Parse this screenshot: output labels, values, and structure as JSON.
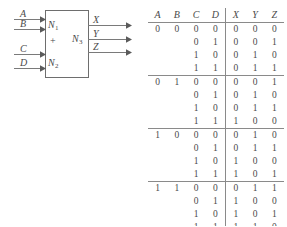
{
  "diagram": {
    "inputs": [
      {
        "label": "A"
      },
      {
        "label": "B"
      },
      {
        "label": "C"
      },
      {
        "label": "D"
      }
    ],
    "blocks": [
      {
        "name": "N",
        "sub": "1"
      },
      {
        "name": "N",
        "sub": "2"
      },
      {
        "name": "N",
        "sub": "3"
      }
    ],
    "operator": "+",
    "outputs": [
      {
        "label": "X"
      },
      {
        "label": "Y"
      },
      {
        "label": "Z"
      }
    ],
    "line_color": "#7a7a7a",
    "box_color": "#6e6e6e"
  },
  "truth_table": {
    "input_headers": [
      "A",
      "B",
      "C",
      "D"
    ],
    "output_headers": [
      "X",
      "Y",
      "Z"
    ],
    "rows": [
      {
        "a": "0",
        "b": "0",
        "c": "0",
        "d": "0",
        "x": "0",
        "y": "0",
        "z": "0",
        "group_start": true
      },
      {
        "a": "",
        "b": "",
        "c": "0",
        "d": "1",
        "x": "0",
        "y": "0",
        "z": "1",
        "group_start": false
      },
      {
        "a": "",
        "b": "",
        "c": "1",
        "d": "0",
        "x": "0",
        "y": "1",
        "z": "0",
        "group_start": false
      },
      {
        "a": "",
        "b": "",
        "c": "1",
        "d": "1",
        "x": "0",
        "y": "1",
        "z": "1",
        "group_start": false
      },
      {
        "a": "0",
        "b": "1",
        "c": "0",
        "d": "0",
        "x": "0",
        "y": "0",
        "z": "1",
        "group_start": true
      },
      {
        "a": "",
        "b": "",
        "c": "0",
        "d": "1",
        "x": "0",
        "y": "1",
        "z": "0",
        "group_start": false
      },
      {
        "a": "",
        "b": "",
        "c": "1",
        "d": "0",
        "x": "0",
        "y": "1",
        "z": "1",
        "group_start": false
      },
      {
        "a": "",
        "b": "",
        "c": "1",
        "d": "1",
        "x": "1",
        "y": "0",
        "z": "0",
        "group_start": false
      },
      {
        "a": "1",
        "b": "0",
        "c": "0",
        "d": "0",
        "x": "0",
        "y": "1",
        "z": "0",
        "group_start": true
      },
      {
        "a": "",
        "b": "",
        "c": "0",
        "d": "1",
        "x": "0",
        "y": "1",
        "z": "1",
        "group_start": false
      },
      {
        "a": "",
        "b": "",
        "c": "1",
        "d": "0",
        "x": "1",
        "y": "0",
        "z": "0",
        "group_start": false
      },
      {
        "a": "",
        "b": "",
        "c": "1",
        "d": "1",
        "x": "1",
        "y": "0",
        "z": "1",
        "group_start": false
      },
      {
        "a": "1",
        "b": "1",
        "c": "0",
        "d": "0",
        "x": "0",
        "y": "1",
        "z": "1",
        "group_start": true
      },
      {
        "a": "",
        "b": "",
        "c": "0",
        "d": "1",
        "x": "1",
        "y": "0",
        "z": "0",
        "group_start": false
      },
      {
        "a": "",
        "b": "",
        "c": "1",
        "d": "0",
        "x": "1",
        "y": "0",
        "z": "1",
        "group_start": false
      },
      {
        "a": "",
        "b": "",
        "c": "1",
        "d": "1",
        "x": "1",
        "y": "1",
        "z": "0",
        "group_start": false
      }
    ],
    "rule_color": "#8a8a8a"
  }
}
